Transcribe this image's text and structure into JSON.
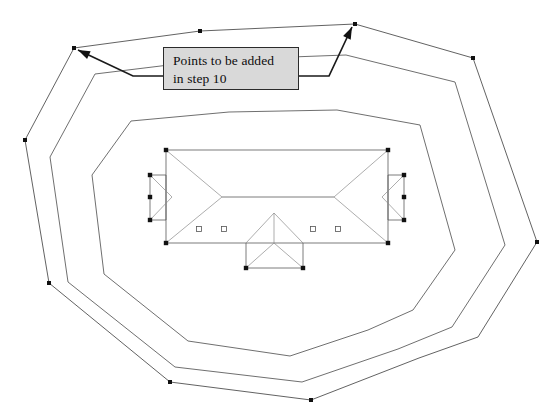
{
  "document": {
    "title": "Roof Plan - Nested Contours",
    "background_color": "#ffffff",
    "width": 558,
    "height": 420
  },
  "callout": {
    "id": "points-callout",
    "text": "Points to be added\nin step 10",
    "line1": "Points to be added",
    "line2": "in step 10",
    "fill_color": "#d9d9d9",
    "border_color": "#2b2b2b",
    "text_color": "#0d0d0d",
    "x": 163,
    "y": 47,
    "width": 136,
    "height": 43
  },
  "leaders": [
    {
      "name": "leader-to-left-vertex",
      "from_x": 163,
      "from_y": 76,
      "to_x": 78,
      "to_y": 50,
      "target_vertex": "outer-top-left-vertex"
    },
    {
      "name": "leader-to-right-vertex",
      "from_x": 299,
      "from_y": 76,
      "to_x": 352,
      "to_y": 27,
      "target_vertex": "outer-top-right-vertex"
    }
  ],
  "geometry": {
    "stroke_color": "#3a3a3a",
    "contours": [
      {
        "name": "outer-contour",
        "label": "Outermost offset polygon",
        "points": [
          [
            74,
            48
          ],
          [
            200,
            31
          ],
          [
            355,
            24
          ],
          [
            473,
            58
          ],
          [
            537,
            242
          ],
          [
            478,
            337
          ],
          [
            419,
            358
          ],
          [
            311,
            400
          ],
          [
            170,
            382
          ],
          [
            49,
            283
          ],
          [
            25,
            140
          ],
          [
            74,
            48
          ]
        ],
        "vertex_markers": [
          [
            74,
            48
          ],
          [
            200,
            31
          ],
          [
            355,
            24
          ],
          [
            473,
            58
          ],
          [
            537,
            242
          ],
          [
            311,
            400
          ],
          [
            170,
            382
          ],
          [
            49,
            283
          ],
          [
            25,
            140
          ]
        ]
      },
      {
        "name": "middle-contour",
        "label": "Middle offset polygon",
        "points": [
          [
            95,
            74
          ],
          [
            210,
            60
          ],
          [
            346,
            55
          ],
          [
            455,
            82
          ],
          [
            505,
            245
          ],
          [
            452,
            327
          ],
          [
            398,
            349
          ],
          [
            302,
            382
          ],
          [
            175,
            367
          ],
          [
            68,
            282
          ],
          [
            50,
            157
          ],
          [
            95,
            74
          ]
        ],
        "vertex_markers": []
      },
      {
        "name": "inner-contour",
        "label": "Inner offset polygon",
        "points": [
          [
            131,
            121
          ],
          [
            229,
            112
          ],
          [
            337,
            110
          ],
          [
            420,
            125
          ],
          [
            455,
            250
          ],
          [
            413,
            310
          ],
          [
            368,
            330
          ],
          [
            290,
            356
          ],
          [
            188,
            341
          ],
          [
            104,
            274
          ],
          [
            92,
            175
          ],
          [
            131,
            121
          ]
        ],
        "vertex_markers": []
      }
    ],
    "roof": {
      "name": "central-roof-plan",
      "main_rect": {
        "x1": 166,
        "y1": 150,
        "x2": 388,
        "y2": 243
      },
      "ridge": {
        "x1": 222,
        "y1": 197,
        "x2": 334,
        "y2": 197
      },
      "hip_lines": [
        [
          166,
          150,
          222,
          197
        ],
        [
          388,
          150,
          334,
          197
        ],
        [
          166,
          243,
          222,
          197
        ],
        [
          388,
          243,
          334,
          197
        ]
      ],
      "left_wing": {
        "name": "left-wing-chevron",
        "outline": [
          [
            150,
            175
          ],
          [
            166,
            175
          ],
          [
            166,
            220
          ],
          [
            150,
            220
          ],
          [
            150,
            175
          ]
        ],
        "notch": [
          [
            150,
            175
          ],
          [
            172,
            197
          ],
          [
            150,
            220
          ]
        ]
      },
      "right_wing": {
        "name": "right-wing-chevron",
        "outline": [
          [
            388,
            175
          ],
          [
            404,
            175
          ],
          [
            404,
            220
          ],
          [
            388,
            220
          ],
          [
            388,
            175
          ]
        ],
        "notch": [
          [
            404,
            175
          ],
          [
            382,
            197
          ],
          [
            404,
            220
          ]
        ]
      },
      "front_gable": {
        "name": "front-gable-dormer",
        "outline": [
          [
            246,
            243
          ],
          [
            246,
            268
          ],
          [
            303,
            268
          ],
          [
            303,
            243
          ]
        ],
        "apex": [
          274,
          213
        ],
        "roof_edges": [
          [
            246,
            243,
            274,
            213
          ],
          [
            274,
            213,
            303,
            243
          ],
          [
            274,
            213,
            274,
            243
          ],
          [
            246,
            268,
            274,
            243
          ],
          [
            303,
            268,
            274,
            243
          ]
        ]
      },
      "skylights": [
        {
          "name": "skylight-1",
          "x": 199,
          "y": 229,
          "size": 5
        },
        {
          "name": "skylight-2",
          "x": 224,
          "y": 229,
          "size": 5
        },
        {
          "name": "skylight-3",
          "x": 313,
          "y": 229,
          "size": 5
        },
        {
          "name": "skylight-4",
          "x": 338,
          "y": 229,
          "size": 5
        }
      ],
      "corner_markers": [
        [
          166,
          150
        ],
        [
          388,
          150
        ],
        [
          166,
          243
        ],
        [
          388,
          243
        ],
        [
          150,
          175
        ],
        [
          150,
          197
        ],
        [
          150,
          220
        ],
        [
          404,
          175
        ],
        [
          404,
          197
        ],
        [
          404,
          220
        ],
        [
          246,
          268
        ],
        [
          303,
          268
        ]
      ]
    }
  }
}
